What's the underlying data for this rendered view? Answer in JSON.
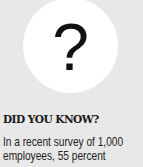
{
  "graphic": {
    "icon": "question-mark-icon",
    "glyph": "?",
    "circle_color": "#ffffff",
    "background_color": "#e8e8e8"
  },
  "heading": "DID YOU KNOW?",
  "body": {
    "lines": [
      "In a recent survey of 1,000",
      "employees, 55 percent"
    ]
  }
}
